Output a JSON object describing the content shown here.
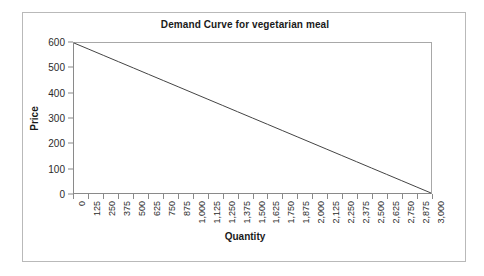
{
  "chart_data": {
    "type": "line",
    "title": "Demand Curve for vegetarian meal",
    "xlabel": "Quantity",
    "ylabel": "Price",
    "xlim": [
      0,
      3000
    ],
    "ylim": [
      0,
      600
    ],
    "grid": false,
    "legend": null,
    "x_tick_labels": [
      "0",
      "125",
      "250",
      "375",
      "500",
      "625",
      "750",
      "875",
      "1,000",
      "1,125",
      "1,250",
      "1,375",
      "1,500",
      "1,625",
      "1,750",
      "1,875",
      "2,000",
      "2,125",
      "2,250",
      "2,375",
      "2,500",
      "2,625",
      "2,750",
      "2,875",
      "3,000"
    ],
    "x_tick_values": [
      0,
      125,
      250,
      375,
      500,
      625,
      750,
      875,
      1000,
      1125,
      1250,
      1375,
      1500,
      1625,
      1750,
      1875,
      2000,
      2125,
      2250,
      2375,
      2500,
      2625,
      2750,
      2875,
      3000
    ],
    "y_tick_labels": [
      "600",
      "500",
      "400",
      "300",
      "200",
      "100",
      "0"
    ],
    "y_tick_values": [
      600,
      500,
      400,
      300,
      200,
      100,
      0
    ],
    "series": [
      {
        "name": "Demand",
        "color": "#444444",
        "x": [
          0,
          125,
          250,
          375,
          500,
          625,
          750,
          875,
          1000,
          1125,
          1250,
          1375,
          1500,
          1625,
          1750,
          1875,
          2000,
          2125,
          2250,
          2375,
          2500,
          2625,
          2750,
          2875,
          3000
        ],
        "values": [
          600,
          575,
          550,
          525,
          500,
          475,
          450,
          425,
          400,
          375,
          350,
          325,
          300,
          275,
          250,
          225,
          200,
          175,
          150,
          125,
          100,
          75,
          50,
          25,
          0
        ]
      }
    ]
  },
  "style": {
    "frame_color": "#b9b9b9",
    "axis_color": "#8a8a8a",
    "line_color": "#444444",
    "text_color": "#1a1a1a",
    "background": "#ffffff"
  }
}
